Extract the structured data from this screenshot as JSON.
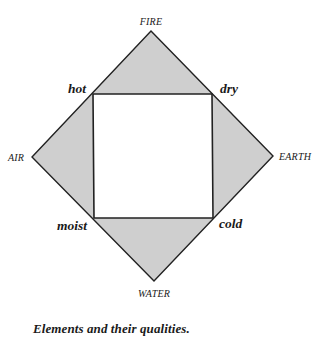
{
  "figure": {
    "caption": "Elements and their qualities.",
    "colors": {
      "fill": "#cfcfcf",
      "stroke": "#222222",
      "background": "#ffffff",
      "text": "#1a1a1a"
    },
    "elements": {
      "top": "FIRE",
      "left": "AIR",
      "right": "EARTH",
      "bottom": "WATER"
    },
    "qualities": {
      "top_left": "hot",
      "top_right": "dry",
      "bottom_left": "moist",
      "bottom_right": "cold"
    }
  }
}
